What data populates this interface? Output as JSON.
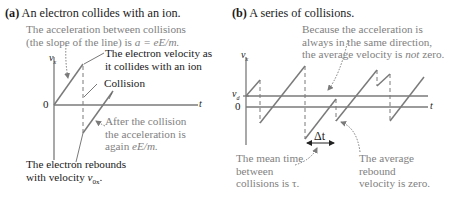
{
  "panel_a": {
    "label": "(a)",
    "title": "An electron collides with an ion.",
    "annotations": {
      "acceleration_line1": "The acceleration between collisions",
      "acceleration_line2_prefix": "(the slope of the line) is ",
      "acceleration_formula": "a = eE/m.",
      "velocity_line1": "The electron velocity as",
      "velocity_line2": "it collides with an ion",
      "collision": "Collision",
      "after_line1": "After the collision",
      "after_line2": "the acceleration is",
      "after_line3_prefix": "again ",
      "after_formula": "eE/m.",
      "rebound_line1": "The electron rebounds",
      "rebound_line2_prefix": "with velocity ",
      "rebound_symbol": "v",
      "rebound_sub": "0x",
      "rebound_suffix": "."
    },
    "axes": {
      "y_label": "v",
      "y_sub": "x",
      "x_label": "t",
      "zero_label": "0"
    }
  },
  "panel_b": {
    "label": "(b)",
    "title": "A series of collisions.",
    "annotations": {
      "because_line1": "Because the acceleration is",
      "because_line2": "always in the same direction,",
      "because_line3_prefix": "the average velocity is ",
      "because_emph": "not",
      "because_line3_suffix": " zero.",
      "meantime_line1": "The mean time",
      "meantime_line2": "between",
      "meantime_line3": "collisions is τ.",
      "rebound_line1": "The average",
      "rebound_line2": "rebound",
      "rebound_line3": "velocity is zero.",
      "delta_t": "Δt"
    },
    "axes": {
      "y_label": "v",
      "y_sub": "x",
      "x_label": "t",
      "zero_label": "0",
      "vd_label": "v",
      "vd_sub": "d"
    }
  },
  "colors": {
    "line": "#7a7a7a",
    "text": "#1a1a1a",
    "annotation_grey": "#7f7f7f"
  }
}
